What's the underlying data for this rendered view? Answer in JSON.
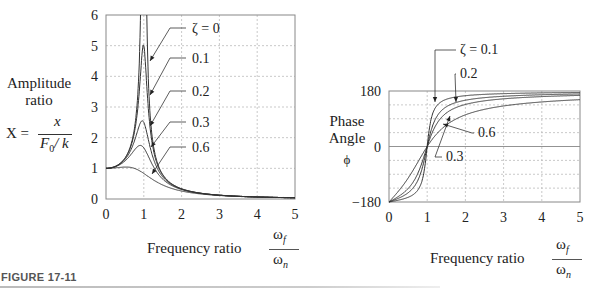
{
  "figure": {
    "label": "FIGURE 17-11",
    "rule_color": "#bbbbbb"
  },
  "left": {
    "ylabel_line1": "Amplitude",
    "ylabel_line2": "ratio",
    "formula_lhs": "X =",
    "formula_num": "x",
    "formula_den_F": "F",
    "formula_den_sub": "0",
    "formula_den_rest": "/ k",
    "xlabel": "Frequency ratio",
    "xfrac_num": "ω",
    "xfrac_num_sub": "f",
    "xfrac_den": "ω",
    "xfrac_den_sub": "n",
    "annotations": [
      "ζ = 0",
      "0.1",
      "0.2",
      "0.3",
      "0.6"
    ]
  },
  "right": {
    "ylabel_line1": "Phase",
    "ylabel_line2": "Angle",
    "ylabel_symbol": "ϕ",
    "xlabel": "Frequency ratio",
    "xfrac_num": "ω",
    "xfrac_num_sub": "f",
    "xfrac_den": "ω",
    "xfrac_den_sub": "n",
    "annotations": [
      "ζ = 0.1",
      "0.2",
      "0.3",
      "0.6"
    ]
  },
  "chart_data": [
    {
      "type": "line",
      "title": "",
      "xlabel": "Frequency ratio ωf/ωn",
      "ylabel": "Amplitude ratio X = x/(F0/k)",
      "xlim": [
        0,
        5
      ],
      "ylim": [
        0,
        6
      ],
      "xticks": [
        0,
        1,
        2,
        3,
        4,
        5
      ],
      "yticks": [
        0,
        1,
        2,
        3,
        4,
        5,
        6
      ],
      "grid": true,
      "legend": "inline annotations with arrows",
      "series": [
        {
          "name": "ζ = 0",
          "zeta": 0,
          "x": [
            0,
            0.5,
            0.8,
            0.9,
            0.95,
            1.05,
            1.1,
            1.2,
            1.5,
            2,
            3,
            4,
            5
          ],
          "y": [
            1.0,
            1.33,
            2.78,
            5.26,
            10.3,
            9.76,
            4.76,
            2.27,
            0.8,
            0.33,
            0.125,
            0.067,
            0.042
          ]
        },
        {
          "name": "0.1",
          "zeta": 0.1,
          "x": [
            0,
            0.5,
            0.8,
            0.9,
            1.0,
            1.1,
            1.2,
            1.5,
            2,
            3,
            4,
            5
          ],
          "y": [
            1.0,
            1.32,
            2.54,
            3.82,
            5.0,
            3.28,
            2.0,
            0.78,
            0.33,
            0.125,
            0.067,
            0.042
          ]
        },
        {
          "name": "0.2",
          "zeta": 0.2,
          "x": [
            0,
            0.5,
            0.8,
            0.96,
            1.0,
            1.2,
            1.5,
            2,
            3,
            4,
            5
          ],
          "y": [
            1.0,
            1.29,
            2.05,
            2.55,
            2.5,
            1.65,
            0.74,
            0.32,
            0.124,
            0.066,
            0.042
          ]
        },
        {
          "name": "0.3",
          "zeta": 0.3,
          "x": [
            0,
            0.5,
            0.8,
            0.9,
            1.0,
            1.2,
            1.5,
            2,
            3,
            4,
            5
          ],
          "y": [
            1.0,
            1.24,
            1.66,
            1.75,
            1.67,
            1.3,
            0.68,
            0.31,
            0.122,
            0.066,
            0.041
          ]
        },
        {
          "name": "0.6",
          "zeta": 0.6,
          "x": [
            0,
            0.5,
            0.8,
            1.0,
            1.2,
            1.5,
            2,
            3,
            4,
            5
          ],
          "y": [
            1.0,
            1.08,
            0.98,
            0.83,
            0.66,
            0.48,
            0.27,
            0.115,
            0.064,
            0.041
          ]
        }
      ]
    },
    {
      "type": "line",
      "title": "",
      "xlabel": "Frequency ratio ωf/ωn",
      "ylabel": "Phase Angle ϕ",
      "xlim": [
        0,
        5
      ],
      "ylim": [
        -180,
        180
      ],
      "xticks": [
        0,
        1,
        2,
        3,
        4,
        5
      ],
      "yticks": [
        -180,
        0,
        180
      ],
      "grid": true,
      "legend": "inline annotations with arrows",
      "series": [
        {
          "name": "ζ = 0.1",
          "zeta": 0.1,
          "x": [
            0,
            0.5,
            0.8,
            1.0,
            1.2,
            1.5,
            2,
            3,
            4,
            5
          ],
          "y": [
            -180,
            -172,
            -156,
            0,
            142,
            158,
            166,
            173,
            175,
            176
          ]
        },
        {
          "name": "0.2",
          "zeta": 0.2,
          "x": [
            0,
            0.5,
            0.8,
            1.0,
            1.2,
            1.5,
            2,
            3,
            4,
            5
          ],
          "y": [
            -180,
            -164,
            -132,
            0,
            118,
            140,
            152,
            165,
            170,
            172
          ]
        },
        {
          "name": "0.3",
          "zeta": 0.3,
          "x": [
            0,
            0.5,
            0.8,
            1.0,
            1.2,
            1.5,
            2,
            3,
            4,
            5
          ],
          "y": [
            -180,
            -156,
            -112,
            0,
            100,
            126,
            141,
            158,
            165,
            169
          ]
        },
        {
          "name": "0.6",
          "zeta": 0.6,
          "x": [
            0,
            0.5,
            0.8,
            1.0,
            1.2,
            1.5,
            2,
            3,
            4,
            5
          ],
          "y": [
            -180,
            -136,
            -74,
            0,
            66,
            92,
            112,
            136,
            148,
            154
          ]
        }
      ]
    }
  ]
}
